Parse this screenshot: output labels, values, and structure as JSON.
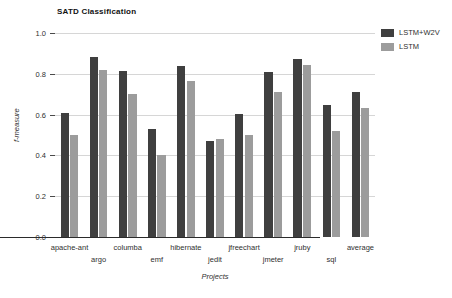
{
  "chart_data": {
    "type": "bar",
    "title": "SATD Classification",
    "xlabel": "Projects",
    "ylabel": "f-measure",
    "ylim": [
      0.0,
      1.0
    ],
    "yticks": [
      "0.0",
      "0.2",
      "0.4",
      "0.6",
      "0.8",
      "1.0"
    ],
    "ytick_values": [
      0.0,
      0.2,
      0.4,
      0.6,
      0.8,
      1.0
    ],
    "grid": true,
    "legend_position": "upper right (outside)",
    "categories": [
      "apache-ant",
      "argo",
      "columba",
      "emf",
      "hibernate",
      "jedit",
      "jfreechart",
      "jmeter",
      "jruby",
      "sql",
      "average"
    ],
    "series": [
      {
        "name": "LSTM+W2V",
        "color": "#3f3f3f",
        "values": [
          0.61,
          0.88,
          0.815,
          0.53,
          0.84,
          0.47,
          0.605,
          0.81,
          0.875,
          0.645,
          0.71
        ]
      },
      {
        "name": "LSTM",
        "color": "#9c9c9c",
        "values": [
          0.5,
          0.82,
          0.7,
          0.4,
          0.765,
          0.48,
          0.5,
          0.71,
          0.845,
          0.52,
          0.63
        ]
      }
    ]
  }
}
